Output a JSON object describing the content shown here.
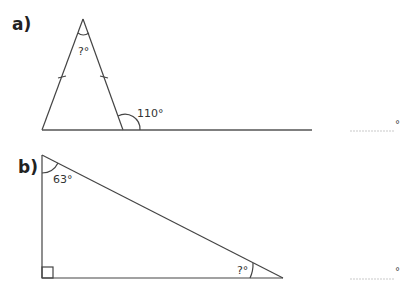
{
  "questions": [
    {
      "label": "a)",
      "unknown_angle_label": "?°",
      "given_angle_label": "110°",
      "answer_unit": "°"
    },
    {
      "label": "b)",
      "given_angle_label": "63°",
      "unknown_angle_label": "?°",
      "answer_unit": "°"
    }
  ]
}
